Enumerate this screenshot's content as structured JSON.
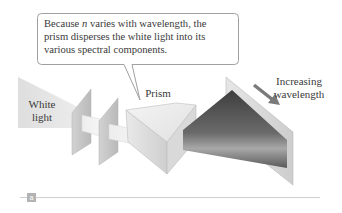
{
  "figure": {
    "callout": {
      "line1_pre": "Because ",
      "line1_var": "n",
      "line1_post": " varies with wavelength, the",
      "line2": "prism disperses the white light into its",
      "line3": "various spectral components."
    },
    "labels": {
      "white_light_1": "White",
      "white_light_2": "light",
      "prism": "Prism",
      "increasing_1": "Increasing",
      "increasing_2": "wavelength"
    },
    "part_label": "a",
    "colors": {
      "text": "#3a3a3a",
      "callout_border": "#9a9a9a",
      "white_light": "#e2e2e2",
      "screen": "#c9c9c9",
      "prism_light": "#efefef",
      "prism_shade": "#d6d6d6",
      "spectrum_dark": "#4a4a4a",
      "spectrum_light": "#9b9b9b",
      "arrow": "#7a7a7a",
      "rule": "#cfcfcf",
      "part_tag_bg": "#b3b3b3"
    }
  }
}
